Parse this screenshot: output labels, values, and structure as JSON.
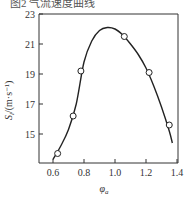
{
  "caption_fragment": "图2 气流速度曲线",
  "chart_data": {
    "type": "line",
    "title": "",
    "xlabel": "φa",
    "ylabel": "Sl/(m·s⁻¹)",
    "xlim": [
      0.55,
      1.4
    ],
    "ylim": [
      13,
      23
    ],
    "xticks": [
      "0.6",
      "0.8",
      "1.0",
      "1.2",
      "1.4"
    ],
    "yticks": [
      "15",
      "17",
      "19",
      "21",
      "23"
    ],
    "grid": false,
    "legend": null,
    "series": [
      {
        "name": "measured",
        "marker": "open-circle",
        "x": [
          0.63,
          0.73,
          0.78,
          1.06,
          1.22,
          1.35
        ],
        "y": [
          13.7,
          16.2,
          19.2,
          21.5,
          19.1,
          15.6
        ]
      },
      {
        "name": "fit-curve",
        "marker": "none",
        "x": [
          0.6,
          0.65,
          0.7,
          0.75,
          0.8,
          0.85,
          0.9,
          0.95,
          1.0,
          1.05,
          1.1,
          1.15,
          1.2,
          1.25,
          1.3,
          1.35,
          1.37
        ],
        "y": [
          13.3,
          14.2,
          15.3,
          17.0,
          19.8,
          21.2,
          21.9,
          22.1,
          22.0,
          21.6,
          21.0,
          20.3,
          19.4,
          18.2,
          16.8,
          15.2,
          14.4
        ]
      }
    ]
  },
  "labels": {
    "x_axis": "φ",
    "x_axis_sub": "a",
    "y_axis": "S",
    "y_axis_sub": "l",
    "y_axis_unit": "/(m·s⁻¹)"
  }
}
